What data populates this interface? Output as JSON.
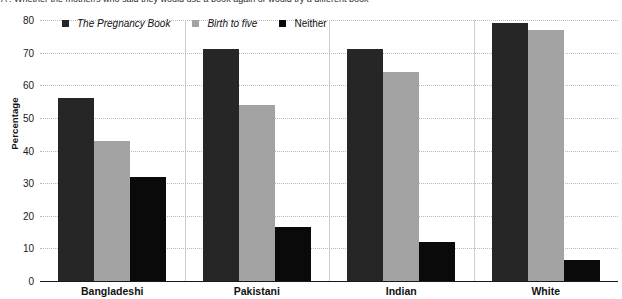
{
  "title_clipped": "A : Whether the mother/s who said they would use a book again or would try a different book",
  "legend": {
    "position": "top-left-inside",
    "items": [
      {
        "label": "The Pregnancy Book",
        "color": "#262626",
        "italic": true
      },
      {
        "label": "Birth to five",
        "color": "#a3a3a3",
        "italic": true
      },
      {
        "label": "Neither",
        "color": "#0a0a0a",
        "italic": false
      }
    ]
  },
  "chart_data": {
    "type": "bar",
    "title": "",
    "xlabel": "",
    "ylabel": "Percentage",
    "ylim": [
      0,
      80
    ],
    "yticks": [
      0,
      10,
      20,
      30,
      40,
      50,
      60,
      70,
      80
    ],
    "grid": true,
    "categories": [
      "Bangladeshi",
      "Pakistani",
      "Indian",
      "White"
    ],
    "series": [
      {
        "name": "The Pregnancy Book",
        "color": "#262626",
        "values": [
          56,
          71,
          71,
          79
        ]
      },
      {
        "name": "Birth to five",
        "color": "#a3a3a3",
        "values": [
          43,
          54,
          64,
          77
        ]
      },
      {
        "name": "Neither",
        "color": "#0a0a0a",
        "values": [
          32,
          16.5,
          12,
          6.5
        ]
      }
    ]
  }
}
